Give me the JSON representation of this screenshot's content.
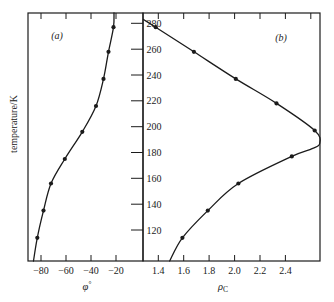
{
  "figure": {
    "bg": "#ffffff",
    "ink": "#1b1b1b",
    "yaxis_label": "temperature/K",
    "ylim": [
      96,
      288
    ],
    "yticks": [
      280,
      260,
      240,
      220,
      200,
      180,
      160,
      140,
      120
    ]
  },
  "chart_data": [
    {
      "type": "line",
      "panel_label": "(a)",
      "xlabel": "φ°",
      "xlabel_parts": {
        "base": "φ",
        "script": "°",
        "script_pos": "sup"
      },
      "ylabel": "temperature/K",
      "xlim": [
        -90.4,
        1.6
      ],
      "ylim": [
        96,
        288
      ],
      "grid": false,
      "xticks": [
        -80,
        -60,
        -40,
        -20
      ],
      "xtick_labels": [
        "−80",
        "−60",
        "−40",
        "−20"
      ],
      "xticks_top": [
        -80,
        -60,
        -40,
        -20
      ],
      "series": [
        {
          "name": "phi-degree-vs-temperature",
          "markers": [
            [
              -22,
              277
            ],
            [
              -26,
              258
            ],
            [
              -30,
              237
            ],
            [
              -36,
              216
            ],
            [
              -47,
              196
            ],
            [
              -61,
              175
            ],
            [
              -72,
              156
            ],
            [
              -78,
              135
            ],
            [
              -83,
              114
            ]
          ],
          "curve": [
            [
              -21.6,
              288
            ],
            [
              -22,
              277
            ],
            [
              -26,
              258
            ],
            [
              -30,
              237
            ],
            [
              -36,
              216
            ],
            [
              -47,
              196
            ],
            [
              -61,
              175
            ],
            [
              -72,
              156
            ],
            [
              -78,
              135
            ],
            [
              -83,
              114
            ],
            [
              -86,
              96
            ]
          ]
        }
      ]
    },
    {
      "type": "line",
      "panel_label": "(b)",
      "xlabel": "ρC",
      "xlabel_parts": {
        "base": "ρ",
        "script": "C",
        "script_pos": "sub"
      },
      "ylabel": "temperature/K",
      "xlim": [
        1.28,
        2.672
      ],
      "ylim": [
        96,
        288
      ],
      "grid": false,
      "xticks": [
        1.4,
        1.6,
        1.8,
        2.0,
        2.2,
        2.4
      ],
      "xtick_labels": [
        "1.4",
        "1.6",
        "1.8",
        "2.0",
        "2.2",
        "2.4"
      ],
      "xticks_top": [
        1.4,
        1.6,
        1.8,
        2.0,
        2.2,
        2.4,
        2.6
      ],
      "series": [
        {
          "name": "rho-C-vs-temperature",
          "markers": [
            [
              1.38,
              277
            ],
            [
              1.68,
              258
            ],
            [
              2.01,
              237
            ],
            [
              2.33,
              218
            ],
            [
              2.63,
              197
            ],
            [
              2.45,
              177
            ],
            [
              2.03,
              156
            ],
            [
              1.79,
              135
            ],
            [
              1.59,
              114
            ]
          ],
          "curve": [
            [
              1.285,
              283
            ],
            [
              1.38,
              277
            ],
            [
              1.68,
              258
            ],
            [
              2.01,
              237
            ],
            [
              2.33,
              218
            ],
            [
              2.63,
              197
            ],
            [
              2.67,
              187
            ],
            [
              2.61,
              183
            ],
            [
              2.45,
              177
            ],
            [
              2.03,
              156
            ],
            [
              1.79,
              135
            ],
            [
              1.59,
              114
            ],
            [
              1.49,
              96
            ]
          ]
        }
      ]
    }
  ]
}
